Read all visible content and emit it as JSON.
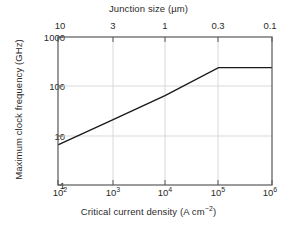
{
  "chart_data": {
    "type": "line",
    "title": "",
    "xlabel": "Critical current density (A cm−2)",
    "ylabel": "Maximum clock frequency (GHz)",
    "top_axis_label": "Junction size (µm)",
    "xscale": "log",
    "yscale": "log",
    "xlim": [
      100,
      1000000
    ],
    "ylim": [
      1,
      1000
    ],
    "grid": true,
    "legend": null,
    "x_tick_labels": [
      "10",
      "10",
      "10",
      "10",
      "10"
    ],
    "x_tick_exponents": [
      "2",
      "3",
      "4",
      "5",
      "6"
    ],
    "x_tick_values": [
      100,
      1000,
      10000,
      100000,
      1000000
    ],
    "y_tick_labels": [
      "1",
      "10",
      "100",
      "1000"
    ],
    "y_tick_values": [
      1,
      10,
      100,
      1000
    ],
    "top_tick_labels": [
      "10",
      "3",
      "1",
      "0.3",
      "0.1"
    ],
    "top_tick_values": [
      10,
      3,
      1,
      0.3,
      0.1
    ],
    "series": [
      {
        "name": "Maximum clock frequency",
        "color": "#1a1a1a",
        "x": [
          100,
          1000,
          10000,
          100000,
          1000000
        ],
        "y": [
          6.5,
          20.5,
          65,
          240,
          240
        ]
      }
    ],
    "line_width": 1.4,
    "frame_color": "#4d4d4d",
    "grid_color": "#d9d9d9",
    "background": "#ffffff"
  },
  "axes": {
    "top_title": "Junction size (µm)",
    "bottom_title_pre": "Critical current density (A cm",
    "bottom_title_exp": "−2",
    "bottom_title_post": ")",
    "y_title": "Maximum clock frequency (GHz)"
  },
  "ticks": {
    "top": [
      {
        "label": "10"
      },
      {
        "label": "3"
      },
      {
        "label": "1"
      },
      {
        "label": "0.3"
      },
      {
        "label": "0.1"
      }
    ],
    "bottom": [
      {
        "mantissa": "10",
        "exp": "2"
      },
      {
        "mantissa": "10",
        "exp": "3"
      },
      {
        "mantissa": "10",
        "exp": "4"
      },
      {
        "mantissa": "10",
        "exp": "5"
      },
      {
        "mantissa": "10",
        "exp": "6"
      }
    ],
    "left": [
      {
        "label": "1000"
      },
      {
        "label": "100"
      },
      {
        "label": "10"
      },
      {
        "label": "1"
      }
    ]
  }
}
